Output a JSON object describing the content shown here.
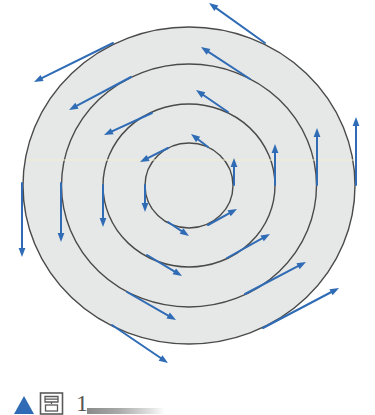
{
  "figure": {
    "colors": {
      "background": "#ffffff",
      "disk_fill": "#e6e7e7",
      "circle_stroke": "#4a4a4a",
      "arrow": "#2f6cb5",
      "scan_line": "#f2efcf"
    },
    "center": [
      189,
      185.5
    ],
    "circles": [
      {
        "name": "outer-circle",
        "rx": 166,
        "ry": 158.5
      },
      {
        "name": "circle-2",
        "rx": 127.5,
        "ry": 121.5
      },
      {
        "name": "circle-3",
        "rx": 86,
        "ry": 81.5
      },
      {
        "name": "inner-circle",
        "rx": 44,
        "ry": 42.5
      }
    ],
    "arrows": [
      {
        "group": "top-left",
        "ring": "outer",
        "from": [
          113,
          43
        ],
        "to": [
          34,
          82
        ]
      },
      {
        "group": "top-left",
        "ring": "2",
        "from": [
          131,
          77
        ],
        "to": [
          69,
          110
        ]
      },
      {
        "group": "top-left",
        "ring": "3",
        "from": [
          152,
          113
        ],
        "to": [
          104,
          135
        ]
      },
      {
        "group": "top-left",
        "ring": "inner",
        "from": [
          168,
          148
        ],
        "to": [
          140,
          162
        ]
      },
      {
        "group": "top-right",
        "ring": "outer",
        "from": [
          265,
          43
        ],
        "to": [
          209,
          3
        ]
      },
      {
        "group": "top-right",
        "ring": "2",
        "from": [
          250,
          79
        ],
        "to": [
          201,
          47
        ]
      },
      {
        "group": "top-right",
        "ring": "3",
        "from": [
          228,
          112
        ],
        "to": [
          196,
          90
        ]
      },
      {
        "group": "top-right",
        "ring": "inner",
        "from": [
          208,
          147
        ],
        "to": [
          191,
          134
        ]
      },
      {
        "group": "right",
        "ring": "outer",
        "from": [
          356,
          185
        ],
        "to": [
          356,
          117
        ]
      },
      {
        "group": "right",
        "ring": "2",
        "from": [
          317,
          185
        ],
        "to": [
          317,
          128
        ]
      },
      {
        "group": "right",
        "ring": "3",
        "from": [
          275,
          185
        ],
        "to": [
          275,
          144
        ]
      },
      {
        "group": "right",
        "ring": "inner",
        "from": [
          234,
          185
        ],
        "to": [
          234,
          158
        ]
      },
      {
        "group": "left",
        "ring": "outer",
        "from": [
          22,
          183
        ],
        "to": [
          22,
          257
        ]
      },
      {
        "group": "left",
        "ring": "2",
        "from": [
          61,
          183
        ],
        "to": [
          61,
          242
        ]
      },
      {
        "group": "left",
        "ring": "3",
        "from": [
          103,
          185
        ],
        "to": [
          103,
          227
        ]
      },
      {
        "group": "left",
        "ring": "inner",
        "from": [
          145,
          185
        ],
        "to": [
          145,
          212
        ]
      },
      {
        "group": "bottom-left",
        "ring": "inner",
        "from": [
          168,
          222
        ],
        "to": [
          189,
          236
        ]
      },
      {
        "group": "bottom-left",
        "ring": "3",
        "from": [
          147,
          255
        ],
        "to": [
          182,
          276
        ]
      },
      {
        "group": "bottom-left",
        "ring": "2",
        "from": [
          127,
          292
        ],
        "to": [
          176,
          320
        ]
      },
      {
        "group": "bottom-left",
        "ring": "outer",
        "from": [
          112,
          325
        ],
        "to": [
          168,
          363
        ]
      },
      {
        "group": "bottom-right",
        "ring": "inner",
        "from": [
          208,
          225
        ],
        "to": [
          237,
          209
        ]
      },
      {
        "group": "bottom-right",
        "ring": "3",
        "from": [
          227,
          258
        ],
        "to": [
          270,
          234
        ]
      },
      {
        "group": "bottom-right",
        "ring": "2",
        "from": [
          245,
          294
        ],
        "to": [
          306,
          262
        ]
      },
      {
        "group": "bottom-right",
        "ring": "outer",
        "from": [
          263,
          328
        ],
        "to": [
          339,
          288
        ]
      }
    ]
  },
  "caption": {
    "marker": "▲",
    "label": "图",
    "number": "1",
    "marker_color": "#2f6cb5"
  }
}
